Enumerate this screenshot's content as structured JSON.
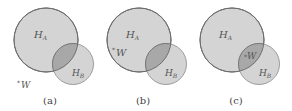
{
  "figure": {
    "colors": {
      "circle_fill": "#d4d4d4",
      "circle_stroke": "#6e6e6e",
      "overlap_fill": "#a8a8a8",
      "text": "#555555"
    },
    "panels": [
      {
        "caption": "(a)",
        "big_circle": {
          "label_main": "H",
          "label_sub": "A"
        },
        "small_circle": {
          "label_main": "H",
          "label_sub": "B"
        },
        "point": {
          "marker": "*",
          "label": "W",
          "location": "outside both circles"
        }
      },
      {
        "caption": "(b)",
        "big_circle": {
          "label_main": "H",
          "label_sub": "A"
        },
        "small_circle": {
          "label_main": "H",
          "label_sub": "B"
        },
        "point": {
          "marker": "*",
          "label": "W",
          "location": "inside H_A only"
        }
      },
      {
        "caption": "(c)",
        "big_circle": {
          "label_main": "H",
          "label_sub": "A"
        },
        "small_circle": {
          "label_main": "H",
          "label_sub": "B"
        },
        "point": {
          "marker": "*",
          "label": "W",
          "location": "inside intersection of H_A and H_B"
        }
      }
    ]
  }
}
